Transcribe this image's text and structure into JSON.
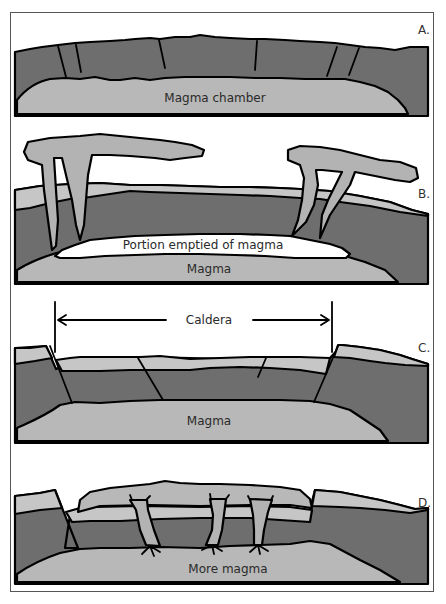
{
  "colors": {
    "rock": "#6e6e6e",
    "magma": "#b8b8b8",
    "upper_layer": "#c6c6c6",
    "ash": "#b3b3b3",
    "empty": "#ffffff",
    "outline": "#000000",
    "frame": "#555555"
  },
  "panels": [
    {
      "id": "A",
      "label": "A.",
      "caption": "Magma chamber"
    },
    {
      "id": "B",
      "label": "B.",
      "caption": "Portion emptied of magma",
      "caption2": "Magma"
    },
    {
      "id": "C",
      "label": "C.",
      "caption": "Magma",
      "span_label": "Caldera"
    },
    {
      "id": "D",
      "label": "D.",
      "caption": "More magma"
    }
  ]
}
